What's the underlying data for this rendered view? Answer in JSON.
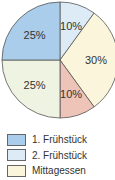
{
  "chart_data": {
    "type": "pie",
    "title": "",
    "start_angle_deg": 0,
    "direction": "clockwise",
    "slices": [
      {
        "label": "2. Frühstück",
        "value": 10,
        "text": "10%",
        "color": "#dcebf6"
      },
      {
        "label": "",
        "value": 30,
        "text": "30%",
        "color": "#fbf5dc"
      },
      {
        "label": "",
        "value": 10,
        "text": "10%",
        "color": "#eec4b9"
      },
      {
        "label": "",
        "value": 25,
        "text": "25%",
        "color": "#eef3e2"
      },
      {
        "label": "1. Frühstück",
        "value": 25,
        "text": "25%",
        "color": "#a9cdea"
      }
    ],
    "legend": [
      {
        "label": "1. Frühstück",
        "color": "#a9cdea"
      },
      {
        "label": "2. Frühstück",
        "color": "#dcebf6"
      },
      {
        "label": "Mittagessen",
        "color": "#fbf5dc"
      }
    ],
    "legend_position": "bottom-left"
  }
}
